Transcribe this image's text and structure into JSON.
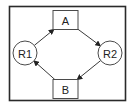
{
  "diagram": {
    "type": "cycle-flow",
    "nodes": [
      {
        "id": "A",
        "label": "A",
        "shape": "rectangle"
      },
      {
        "id": "R2",
        "label": "R2",
        "shape": "circle"
      },
      {
        "id": "B",
        "label": "B",
        "shape": "rectangle"
      },
      {
        "id": "R1",
        "label": "R1",
        "shape": "circle"
      }
    ],
    "edges": [
      {
        "from": "R1",
        "to": "A",
        "directed": true
      },
      {
        "from": "A",
        "to": "R2",
        "directed": true
      },
      {
        "from": "R2",
        "to": "B",
        "directed": true
      },
      {
        "from": "B",
        "to": "R1",
        "directed": true
      }
    ],
    "colors": {
      "stroke": "#3a3a3a",
      "frame": "#2a2a2a",
      "background": "#ffffff",
      "text": "#222222"
    }
  }
}
